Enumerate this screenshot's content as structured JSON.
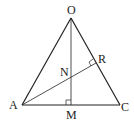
{
  "diagram": {
    "type": "geometry",
    "labels": {
      "O": "O",
      "A": "A",
      "C": "C",
      "M": "M",
      "N": "N",
      "R": "R"
    },
    "points": {
      "O": [
        71,
        18
      ],
      "A": [
        22,
        105
      ],
      "C": [
        120,
        105
      ],
      "M": [
        71,
        105
      ],
      "R": [
        96,
        63
      ],
      "N": [
        71,
        76
      ]
    },
    "segments": [
      [
        "O",
        "A"
      ],
      [
        "O",
        "C"
      ],
      [
        "A",
        "C"
      ],
      [
        "O",
        "M"
      ],
      [
        "A",
        "R"
      ]
    ],
    "right_angles": [
      "M",
      "R"
    ]
  }
}
